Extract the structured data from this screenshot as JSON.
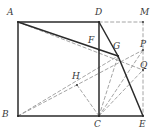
{
  "figure": {
    "width": 156,
    "height": 132,
    "background_color": "#ffffff",
    "solid_stroke_color": "#2b2b2b",
    "dashed_stroke_color": "#9a9a9a",
    "label_color": "#3a3a3a",
    "points": [
      {
        "id": "A",
        "label": "A",
        "x": 18,
        "y": 22,
        "label_x": 7,
        "label_y": 8
      },
      {
        "id": "B",
        "label": "B",
        "x": 18,
        "y": 116,
        "label_x": 2,
        "label_y": 110
      },
      {
        "id": "C",
        "label": "C",
        "x": 99,
        "y": 116,
        "label_x": 94,
        "label_y": 120
      },
      {
        "id": "D",
        "label": "D",
        "x": 99,
        "y": 22,
        "label_x": 95,
        "label_y": 8
      },
      {
        "id": "E",
        "label": "E",
        "x": 143,
        "y": 116,
        "label_x": 139,
        "label_y": 120
      },
      {
        "id": "F",
        "label": "F",
        "x": 99,
        "y": 50,
        "label_x": 88,
        "label_y": 36
      },
      {
        "id": "G",
        "label": "G",
        "x": 118,
        "y": 56,
        "label_x": 113,
        "label_y": 42
      },
      {
        "id": "H",
        "label": "H",
        "x": 77,
        "y": 85,
        "label_x": 72,
        "label_y": 72
      },
      {
        "id": "M",
        "label": "M",
        "x": 143,
        "y": 22,
        "label_x": 140,
        "label_y": 8
      },
      {
        "id": "P",
        "label": "P",
        "x": 143,
        "y": 50,
        "label_x": 140,
        "label_y": 40
      },
      {
        "id": "Q",
        "label": "Q",
        "x": 143,
        "y": 70,
        "label_x": 140,
        "label_y": 61
      }
    ],
    "solid_segments": [
      {
        "name": "segment-AD",
        "from": "A",
        "to": "D"
      },
      {
        "name": "segment-AB",
        "from": "A",
        "to": "B"
      },
      {
        "name": "segment-BC",
        "from": "B",
        "to": "C"
      },
      {
        "name": "segment-CE",
        "from": "C",
        "to": "E"
      },
      {
        "name": "segment-DC",
        "from": "D",
        "to": "C"
      },
      {
        "name": "segment-AG",
        "from": "A",
        "to": "G"
      },
      {
        "name": "segment-DG",
        "from": "D",
        "to": "G"
      },
      {
        "name": "segment-GE",
        "from": "G",
        "to": "E"
      }
    ],
    "dashed_segments": [
      {
        "name": "segment-DM",
        "from": "D",
        "to": "M"
      },
      {
        "name": "segment-ME",
        "from": "M",
        "to": "E"
      },
      {
        "name": "segment-AQ",
        "from": "A",
        "to": "Q"
      },
      {
        "name": "segment-BP",
        "from": "B",
        "to": "P"
      },
      {
        "name": "segment-BG",
        "from": "B",
        "to": "G"
      },
      {
        "name": "segment-CH",
        "from": "C",
        "to": "H"
      },
      {
        "name": "segment-CG",
        "from": "C",
        "to": "G"
      },
      {
        "name": "segment-CQ",
        "from": "C",
        "to": "Q"
      },
      {
        "name": "segment-CP",
        "from": "C",
        "to": "P"
      }
    ]
  }
}
